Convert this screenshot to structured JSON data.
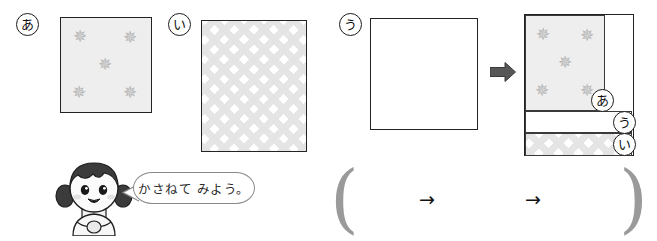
{
  "worksheet": {
    "instruction_text": "かさねて みよう。",
    "sheets": [
      {
        "id": "a",
        "label": "あ",
        "pattern": "stars",
        "pattern_description": "five gray stars on light gray background",
        "star_count": 5
      },
      {
        "id": "i",
        "label": "い",
        "pattern": "lattice",
        "pattern_description": "light gray diamond lattice pattern"
      },
      {
        "id": "u",
        "label": "う",
        "pattern": "plain",
        "pattern_description": "plain white sheet"
      }
    ],
    "arrows": {
      "block_arrow": "right-block-arrow",
      "thin_arrow_1": "→",
      "thin_arrow_2": "→"
    },
    "composite": {
      "bands": [
        {
          "label": "あ",
          "pattern": "stars"
        },
        {
          "label": "う",
          "pattern": "plain"
        },
        {
          "label": "い",
          "pattern": "lattice"
        }
      ]
    },
    "answer_row": {
      "open_paren": "(",
      "close_paren": ")",
      "arrow_1": "→",
      "arrow_2": "→"
    },
    "colors": {
      "outline": "#232323",
      "star_fill": "#b4b4b4",
      "sheet_tint": "#eeeeee",
      "lattice_tint": "#e4e4e4",
      "block_arrow": "#575757",
      "paren": "#9a9a9a"
    }
  }
}
